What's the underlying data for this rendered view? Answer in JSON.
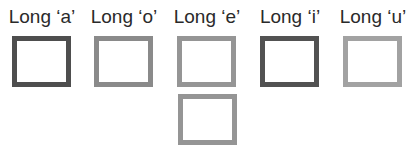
{
  "labels": [
    "Long ‘a’",
    "Long ‘o’",
    "Long ‘e’",
    "Long ‘i’",
    "Long ‘u’"
  ],
  "colors": {
    "a": "#4e4e4e",
    "o": "#8a8a8a",
    "e": "#959595",
    "i": "#525252",
    "u": "#a2a2a2",
    "e_extra": "#959595"
  }
}
